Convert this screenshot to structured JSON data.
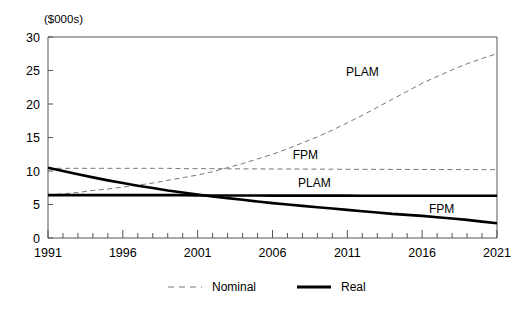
{
  "chart_data": {
    "type": "line",
    "title": "",
    "subtitle": "",
    "unit_label": "($000s)",
    "xlabel": "",
    "ylabel": "",
    "xlim": [
      1991,
      2021
    ],
    "ylim": [
      0,
      30
    ],
    "yticks": [
      0,
      5,
      10,
      15,
      20,
      25,
      30
    ],
    "ytick_labels": [
      "0",
      "5",
      "10",
      "15",
      "20",
      "25",
      "30"
    ],
    "xticks": [
      1991,
      1996,
      2001,
      2006,
      2011,
      2016,
      2021
    ],
    "xtick_labels": [
      "1991",
      "1996",
      "2001",
      "2006",
      "2011",
      "2016",
      "2021"
    ],
    "minor_xtick_interval": 1,
    "grid": false,
    "legend": {
      "position": "bottom",
      "entries": [
        {
          "name": "Nominal",
          "style": "dashed"
        },
        {
          "name": "Real",
          "style": "solid"
        }
      ]
    },
    "x": [
      1991,
      1992,
      1993,
      1994,
      1995,
      1996,
      1997,
      1998,
      1999,
      2000,
      2001,
      2002,
      2003,
      2004,
      2005,
      2006,
      2007,
      2008,
      2009,
      2010,
      2011,
      2012,
      2013,
      2014,
      2015,
      2016,
      2017,
      2018,
      2019,
      2020,
      2021
    ],
    "series": [
      {
        "name": "PLAM Nominal",
        "label": "PLAM",
        "style": "dashed",
        "label_x": 2012,
        "label_y": 24.2,
        "values": [
          6.4,
          6.6,
          6.8,
          7.1,
          7.3,
          7.6,
          7.9,
          8.2,
          8.6,
          9.0,
          9.4,
          9.9,
          10.5,
          11.1,
          11.8,
          12.5,
          13.3,
          14.2,
          15.1,
          16.1,
          17.2,
          18.3,
          19.5,
          20.7,
          21.9,
          23.1,
          24.1,
          25.1,
          26.0,
          26.8,
          27.5
        ]
      },
      {
        "name": "FPM Nominal",
        "label": "FPM",
        "style": "dashed",
        "label_x": 2008.2,
        "label_y": 11.8,
        "values": [
          10.4,
          10.4,
          10.4,
          10.4,
          10.4,
          10.4,
          10.4,
          10.4,
          10.4,
          10.35,
          10.35,
          10.35,
          10.33,
          10.32,
          10.31,
          10.3,
          10.3,
          10.29,
          10.28,
          10.27,
          10.26,
          10.25,
          10.25,
          10.24,
          10.23,
          10.22,
          10.22,
          10.21,
          10.21,
          10.2,
          10.2
        ]
      },
      {
        "name": "PLAM Real",
        "label": "PLAM",
        "style": "solid",
        "label_x": 2008.8,
        "label_y": 7.6,
        "values": [
          6.4,
          6.4,
          6.4,
          6.4,
          6.4,
          6.4,
          6.4,
          6.4,
          6.4,
          6.4,
          6.35,
          6.35,
          6.35,
          6.35,
          6.35,
          6.33,
          6.33,
          6.33,
          6.32,
          6.32,
          6.32,
          6.31,
          6.31,
          6.3,
          6.3,
          6.3,
          6.3,
          6.3,
          6.3,
          6.3,
          6.3
        ]
      },
      {
        "name": "FPM Real",
        "label": "FPM",
        "style": "solid",
        "label_x": 2017.3,
        "label_y": 3.7,
        "values": [
          10.5,
          10.0,
          9.5,
          9.05,
          8.6,
          8.2,
          7.8,
          7.45,
          7.1,
          6.8,
          6.5,
          6.2,
          5.95,
          5.7,
          5.45,
          5.2,
          5.0,
          4.8,
          4.6,
          4.4,
          4.2,
          4.0,
          3.8,
          3.6,
          3.45,
          3.3,
          3.1,
          2.9,
          2.7,
          2.45,
          2.2
        ]
      }
    ]
  },
  "colors": {
    "axis": "#555555",
    "nominal": "#777777",
    "real": "#000000",
    "text": "#000000",
    "background": "#ffffff"
  }
}
